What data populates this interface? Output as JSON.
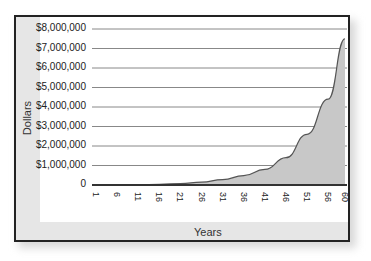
{
  "chart_data": {
    "type": "area",
    "title": "",
    "xlabel": "Years",
    "ylabel": "Dollars",
    "x_tick_labels": [
      "1",
      "6",
      "11",
      "16",
      "21",
      "26",
      "31",
      "36",
      "41",
      "46",
      "51",
      "56",
      "60"
    ],
    "y_tick_labels": [
      "0",
      "$1,000,000",
      "$2,000,000",
      "$3,000,000",
      "$4,000,000",
      "$5,000,000",
      "$6,000,000",
      "$7,000,000",
      "$8,000,000"
    ],
    "ylim": [
      0,
      8000000
    ],
    "xlim": [
      1,
      60
    ],
    "grid": "horizontal",
    "legend": "none",
    "series": [
      {
        "name": "Dollars",
        "x": [
          1,
          6,
          11,
          16,
          21,
          26,
          31,
          36,
          41,
          46,
          51,
          56,
          60
        ],
        "values": [
          0,
          5000,
          15000,
          35000,
          75000,
          150000,
          280000,
          480000,
          800000,
          1400000,
          2600000,
          4400000,
          7500000
        ]
      }
    ],
    "colors": {
      "fill": "#c8c8c8",
      "line": "#555555",
      "grid": "#888888",
      "frame": "#222222"
    }
  }
}
